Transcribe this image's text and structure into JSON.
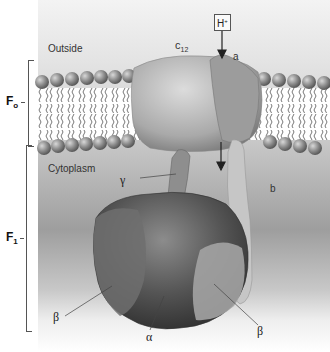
{
  "diagram": {
    "type": "atp-synthase-structure",
    "regions": {
      "outside_label": "Outside",
      "cytoplasm_label": "Cytoplasm"
    },
    "brackets": {
      "fo": {
        "main": "F",
        "sub": "o"
      },
      "f1": {
        "main": "F",
        "sub": "1"
      }
    },
    "proton": {
      "main": "H",
      "sup": "+"
    },
    "subunits": {
      "c12": {
        "main": "c",
        "sub": "12"
      },
      "a": "a",
      "b": "b",
      "gamma": "γ",
      "alpha": "α",
      "beta_left": "β",
      "beta_right": "β"
    },
    "colors": {
      "membrane_head": "#8a8a8a",
      "protein_light": "#b8b8b8",
      "protein_dark": "#4a4a4a",
      "background_top": "#f3f3f3",
      "background_mid": "#b6b6b6"
    }
  }
}
